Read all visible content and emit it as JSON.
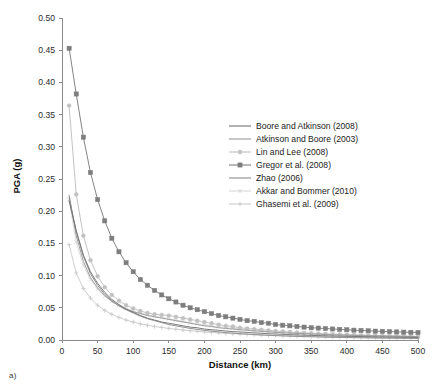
{
  "caption": "a)",
  "chart_data": {
    "type": "line",
    "title": "",
    "xlabel": "Distance (km)",
    "ylabel": "PGA (g)",
    "xlim": [
      0,
      500
    ],
    "ylim": [
      0,
      0.5
    ],
    "xticks": [
      0,
      50,
      100,
      150,
      200,
      250,
      300,
      350,
      400,
      450,
      500
    ],
    "xtick_labels": [
      "0",
      "50",
      "100",
      "150",
      "200",
      "250",
      "300",
      "350",
      "400",
      "450",
      "500"
    ],
    "yticks": [
      0.0,
      0.05,
      0.1,
      0.15,
      0.2,
      0.25,
      0.3,
      0.35,
      0.4,
      0.45,
      0.5
    ],
    "ytick_labels": [
      "0.00",
      "0.05",
      "0.10",
      "0.15",
      "0.20",
      "0.25",
      "0.30",
      "0.35",
      "0.40",
      "0.45",
      "0.50"
    ],
    "grid": false,
    "legend_position": "center-right",
    "x": [
      10,
      20,
      30,
      40,
      50,
      60,
      70,
      80,
      90,
      100,
      110,
      120,
      130,
      140,
      150,
      160,
      170,
      180,
      190,
      200,
      210,
      220,
      230,
      240,
      250,
      260,
      270,
      280,
      290,
      300,
      310,
      320,
      330,
      340,
      350,
      360,
      370,
      380,
      390,
      400,
      410,
      420,
      430,
      440,
      450,
      460,
      470,
      480,
      490,
      500
    ],
    "series": [
      {
        "name": "Boore and Atkinson (2008)",
        "color": "#737373",
        "marker": "none",
        "values": [
          0.216,
          0.17,
          0.132,
          0.106,
          0.088,
          0.074,
          0.063,
          0.055,
          0.048,
          0.043,
          0.038,
          0.034,
          0.031,
          0.028,
          0.026,
          0.024,
          0.022,
          0.02,
          0.019,
          0.017,
          0.016,
          0.015,
          0.014,
          0.013,
          0.0125,
          0.0117,
          0.011,
          0.0104,
          0.0098,
          0.0093,
          0.0088,
          0.0083,
          0.0079,
          0.0075,
          0.0072,
          0.0068,
          0.0065,
          0.0062,
          0.006,
          0.0057,
          0.0055,
          0.0053,
          0.0051,
          0.0049,
          0.0047,
          0.0045,
          0.0044,
          0.0042,
          0.0041,
          0.004
        ]
      },
      {
        "name": "Atkinson and Boore (2003)",
        "color": "#999999",
        "marker": "none",
        "values": [
          0.225,
          0.162,
          0.122,
          0.097,
          0.081,
          0.069,
          0.06,
          0.053,
          0.048,
          0.044,
          0.041,
          0.038,
          0.036,
          0.034,
          0.032,
          0.03,
          0.028,
          0.026,
          0.024,
          0.022,
          0.021,
          0.019,
          0.018,
          0.017,
          0.016,
          0.015,
          0.0141,
          0.0133,
          0.0126,
          0.0119,
          0.0113,
          0.0107,
          0.0102,
          0.0097,
          0.0093,
          0.0089,
          0.0085,
          0.0081,
          0.0078,
          0.0075,
          0.0072,
          0.0069,
          0.0066,
          0.0064,
          0.0062,
          0.006,
          0.0058,
          0.0056,
          0.0054,
          0.0052
        ]
      },
      {
        "name": "Lin and Lee (2008)",
        "color": "#c0c0c0",
        "marker": "circle",
        "values": [
          0.364,
          0.226,
          0.162,
          0.124,
          0.099,
          0.082,
          0.07,
          0.061,
          0.054,
          0.049,
          0.045,
          0.042,
          0.04,
          0.039,
          0.038,
          0.036,
          0.034,
          0.032,
          0.03,
          0.028,
          0.026,
          0.024,
          0.022,
          0.021,
          0.019,
          0.018,
          0.017,
          0.016,
          0.015,
          0.014,
          0.0132,
          0.0124,
          0.0117,
          0.0111,
          0.0105,
          0.01,
          0.0095,
          0.009,
          0.0086,
          0.0082,
          0.0079,
          0.0076,
          0.0073,
          0.007,
          0.0067,
          0.0065,
          0.0062,
          0.006,
          0.0058,
          0.0056
        ]
      },
      {
        "name": "Gregor et al. (2008)",
        "color": "#7d7d7d",
        "marker": "square",
        "values": [
          0.453,
          0.382,
          0.315,
          0.26,
          0.218,
          0.185,
          0.158,
          0.137,
          0.12,
          0.106,
          0.094,
          0.085,
          0.077,
          0.07,
          0.064,
          0.059,
          0.054,
          0.05,
          0.047,
          0.044,
          0.041,
          0.038,
          0.036,
          0.034,
          0.032,
          0.03,
          0.029,
          0.027,
          0.026,
          0.024,
          0.023,
          0.022,
          0.021,
          0.02,
          0.019,
          0.0185,
          0.0178,
          0.0171,
          0.0165,
          0.0159,
          0.0153,
          0.0148,
          0.0143,
          0.0138,
          0.0134,
          0.013,
          0.0126,
          0.0122,
          0.0119,
          0.0116
        ]
      },
      {
        "name": "Zhao (2006)",
        "color": "#8c8c8c",
        "marker": "none",
        "values": [
          0.222,
          0.168,
          0.13,
          0.103,
          0.085,
          0.071,
          0.061,
          0.053,
          0.047,
          0.042,
          0.037,
          0.033,
          0.03,
          0.027,
          0.024,
          0.022,
          0.02,
          0.018,
          0.0165,
          0.015,
          0.0137,
          0.0126,
          0.0115,
          0.0106,
          0.0098,
          0.0091,
          0.0084,
          0.0078,
          0.0073,
          0.0068,
          0.0064,
          0.006,
          0.0056,
          0.0053,
          0.005,
          0.0047,
          0.0044,
          0.0042,
          0.004,
          0.0038,
          0.0036,
          0.0034,
          0.0033,
          0.0031,
          0.003,
          0.0029,
          0.0027,
          0.0026,
          0.0025,
          0.0024
        ]
      },
      {
        "name": "Akkar and Bommer (2010)",
        "color": "#d8d8d8",
        "marker": "cross",
        "values": [
          0.218,
          0.152,
          0.116,
          0.094,
          0.079,
          0.068,
          0.06,
          0.054,
          0.049,
          0.045,
          0.042,
          0.039,
          0.037,
          0.035,
          0.033,
          0.031,
          0.029,
          0.027,
          0.025,
          0.024,
          0.022,
          0.021,
          0.0195,
          0.0183,
          0.0172,
          0.0162,
          0.0152,
          0.0144,
          0.0136,
          0.0129,
          0.0122,
          0.0116,
          0.011,
          0.0105,
          0.01,
          0.0095,
          0.0091,
          0.0087,
          0.0083,
          0.008,
          0.0077,
          0.0074,
          0.0071,
          0.0068,
          0.0066,
          0.0063,
          0.0061,
          0.0059,
          0.0057,
          0.0055
        ]
      },
      {
        "name": "Ghasemi et al. (2009)",
        "color": "#cccccc",
        "marker": "plus",
        "values": [
          0.148,
          0.104,
          0.08,
          0.065,
          0.054,
          0.046,
          0.04,
          0.035,
          0.031,
          0.028,
          0.025,
          0.023,
          0.021,
          0.0195,
          0.018,
          0.0167,
          0.0155,
          0.0145,
          0.0135,
          0.0126,
          0.0118,
          0.0111,
          0.0104,
          0.0098,
          0.0092,
          0.0087,
          0.0082,
          0.0078,
          0.0074,
          0.007,
          0.0066,
          0.0063,
          0.006,
          0.0057,
          0.0054,
          0.0052,
          0.0049,
          0.0047,
          0.0045,
          0.0043,
          0.0041,
          0.004,
          0.0038,
          0.0037,
          0.0035,
          0.0034,
          0.0033,
          0.0032,
          0.0031,
          0.003
        ]
      }
    ]
  }
}
